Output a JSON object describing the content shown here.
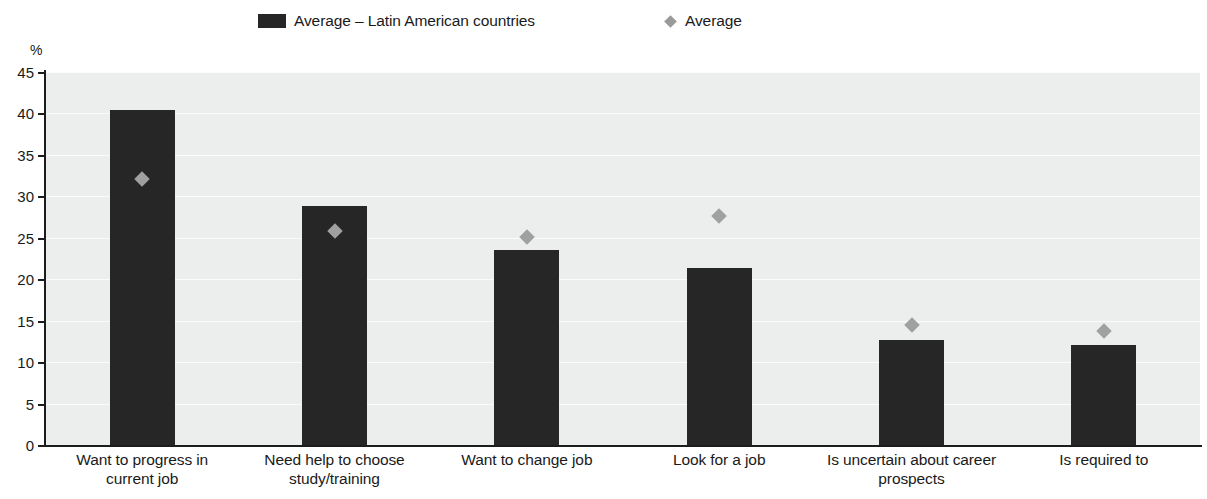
{
  "chart_data": {
    "type": "bar",
    "title": "",
    "subtitle": "",
    "xlabel": "",
    "ylabel": "%",
    "ylim": [
      0,
      45
    ],
    "ytick_values": [
      0,
      5,
      10,
      15,
      20,
      25,
      30,
      35,
      40,
      45
    ],
    "ytick_labels": [
      "0",
      "5",
      "10",
      "15",
      "20",
      "25",
      "30",
      "35",
      "40",
      "45"
    ],
    "grid": true,
    "grid_axis": "y",
    "legend_position": "top",
    "categories": [
      "Want to progress in\ncurrent job",
      "Need help to choose\nstudy/training",
      "Want to change job",
      "Look for a job",
      "Is uncertain about career\nprospects",
      "Is required to"
    ],
    "category_lines": [
      [
        "Want to progress in",
        "current job"
      ],
      [
        "Need help to choose",
        "study/training"
      ],
      [
        "Want to change job"
      ],
      [
        "Look for a job"
      ],
      [
        "Is uncertain about career",
        "prospects"
      ],
      [
        "Is required to"
      ]
    ],
    "series": [
      {
        "name": "Average – Latin American countries",
        "marker": "bar",
        "color": "#262626",
        "values": [
          40.4,
          28.8,
          23.5,
          21.4,
          12.7,
          12.1
        ]
      },
      {
        "name": "Average",
        "marker": "diamond",
        "color": "#a0a0a0",
        "values": [
          32.8,
          26.5,
          25.7,
          28.3,
          15.2,
          14.4
        ]
      }
    ]
  },
  "legend": {
    "entries": [
      {
        "label": "Average – Latin American countries",
        "swatch": "bar-swatch"
      },
      {
        "label": "Average",
        "swatch": "diamond-swatch"
      }
    ]
  },
  "axes": {
    "y_unit": "%"
  },
  "colors": {
    "bar": "#262626",
    "marker": "#a0a0a0",
    "plot_background": "#eceded",
    "gridline": "#fbfbfb",
    "axis": "#1c1c1c",
    "text": "#1a1a1a"
  }
}
